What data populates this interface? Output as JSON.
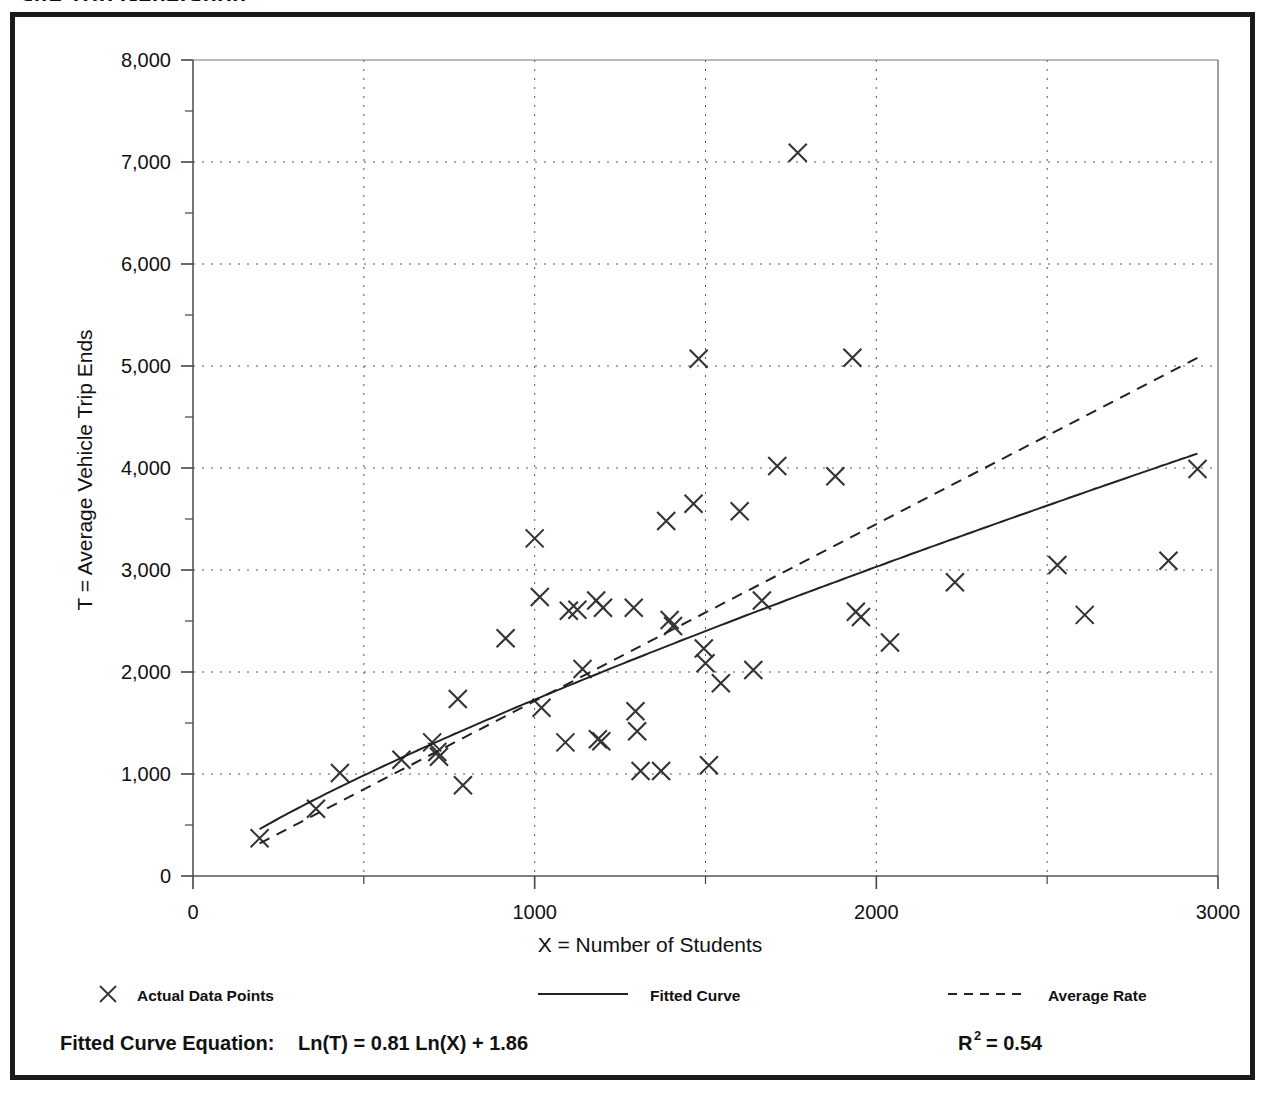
{
  "figure": {
    "clipped_top_title": "Site Trip Generation",
    "border_color": "#1a1a1a",
    "background": "#ffffff"
  },
  "axis": {
    "y_title": "T = Average Vehicle Trip Ends",
    "x_title": "X = Number of Students",
    "y_ticks": [
      "0",
      "1,000",
      "2,000",
      "3,000",
      "4,000",
      "5,000",
      "6,000",
      "7,000",
      "8,000"
    ],
    "x_ticks": [
      "0",
      "1000",
      "2000",
      "3000"
    ]
  },
  "legend": {
    "items": [
      {
        "label": "Actual Data Points",
        "marker": "x-marker",
        "color": "#222222"
      },
      {
        "label": "Fitted Curve",
        "marker": "solid-line",
        "color": "#222222"
      },
      {
        "label": "Average Rate",
        "marker": "dashed-line",
        "color": "#222222"
      }
    ]
  },
  "equation": {
    "fitted_label": "Fitted Curve Equation:",
    "fitted_formula": "Ln(T) = 0.81 Ln(X) + 1.86",
    "r_symbol": "R",
    "r_exponent": "2",
    "r_value": "= 0.54"
  },
  "chart_data": {
    "type": "scatter",
    "title": "Site Trip Generation",
    "xlabel": "X = Number of Students",
    "ylabel": "T = Average Vehicle Trip Ends",
    "xlim": [
      0,
      3000
    ],
    "ylim": [
      0,
      8000
    ],
    "x_major_step": 1000,
    "x_minor_step": 500,
    "y_major_step": 1000,
    "y_minor_step": 500,
    "grid": "dotted-major-and-vertical-minor",
    "legend_position": "below-axes",
    "series": [
      {
        "name": "Actual Data Points",
        "type": "scatter",
        "marker": "x",
        "points": [
          [
            195,
            370
          ],
          [
            360,
            660
          ],
          [
            430,
            1010
          ],
          [
            610,
            1140
          ],
          [
            700,
            1310
          ],
          [
            715,
            1215
          ],
          [
            720,
            1170
          ],
          [
            775,
            1735
          ],
          [
            790,
            890
          ],
          [
            915,
            2330
          ],
          [
            1000,
            3310
          ],
          [
            1015,
            2735
          ],
          [
            1020,
            1650
          ],
          [
            1090,
            1310
          ],
          [
            1100,
            2600
          ],
          [
            1125,
            2610
          ],
          [
            1140,
            2030
          ],
          [
            1180,
            2700
          ],
          [
            1185,
            1340
          ],
          [
            1195,
            1320
          ],
          [
            1200,
            2630
          ],
          [
            1290,
            2630
          ],
          [
            1295,
            1615
          ],
          [
            1300,
            1420
          ],
          [
            1310,
            1030
          ],
          [
            1370,
            1030
          ],
          [
            1385,
            3480
          ],
          [
            1395,
            2510
          ],
          [
            1405,
            2450
          ],
          [
            1465,
            3650
          ],
          [
            1480,
            5070
          ],
          [
            1495,
            2230
          ],
          [
            1500,
            2085
          ],
          [
            1510,
            1085
          ],
          [
            1545,
            1890
          ],
          [
            1600,
            3575
          ],
          [
            1640,
            2020
          ],
          [
            1665,
            2700
          ],
          [
            1710,
            4020
          ],
          [
            1770,
            7090
          ],
          [
            1880,
            3920
          ],
          [
            1930,
            5080
          ],
          [
            1940,
            2590
          ],
          [
            1955,
            2540
          ],
          [
            2040,
            2290
          ],
          [
            2230,
            2880
          ],
          [
            2530,
            3050
          ],
          [
            2610,
            2560
          ],
          [
            2855,
            3090
          ],
          [
            2940,
            3990
          ]
        ]
      },
      {
        "name": "Fitted Curve",
        "type": "line",
        "style": "solid",
        "equation": "T = exp(1.86) * X^0.81",
        "intercept_ln": 1.86,
        "slope_ln": 0.81,
        "x_from": 195,
        "x_to": 2940
      },
      {
        "name": "Average Rate",
        "type": "line",
        "style": "dashed",
        "description": "straight line through origin-ish average trip rate",
        "x_from": 195,
        "x_to": 2940,
        "y_from": 320,
        "y_to": 5080
      }
    ],
    "r_squared": 0.54
  }
}
